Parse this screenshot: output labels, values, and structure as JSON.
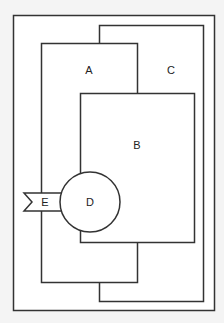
{
  "diagram": {
    "background": "#f4f4f4",
    "fill": "#ffffff",
    "stroke": "#333333",
    "outer_frame": {
      "x": 13,
      "y": 15,
      "w": 201,
      "h": 295
    },
    "shapes": [
      {
        "id": "C",
        "label": "C",
        "type": "rect",
        "x": 99,
        "y": 25,
        "w": 104,
        "h": 276,
        "label_x": 171,
        "label_y": 74
      },
      {
        "id": "A",
        "label": "A",
        "type": "rect",
        "x": 41,
        "y": 43,
        "w": 96,
        "h": 239,
        "label_x": 89,
        "label_y": 74
      },
      {
        "id": "B",
        "label": "B",
        "type": "rect",
        "x": 80,
        "y": 93,
        "w": 114,
        "h": 149,
        "label_x": 137,
        "label_y": 149
      },
      {
        "id": "D",
        "label": "D",
        "type": "circle",
        "cx": 90,
        "cy": 202,
        "r": 30,
        "label_x": 90,
        "label_y": 206
      },
      {
        "id": "E",
        "label": "E",
        "type": "flag",
        "label_x": 45,
        "label_y": 206
      }
    ]
  }
}
